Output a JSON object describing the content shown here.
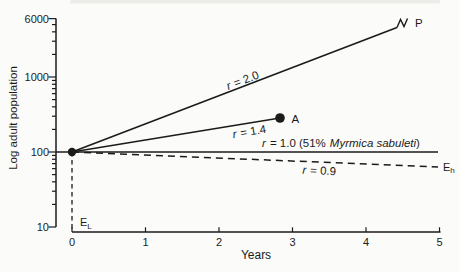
{
  "figure": {
    "ink_color": "#1b1b1b",
    "background_color": "#fbfbf9"
  },
  "chart_data": {
    "type": "line",
    "title": "",
    "xlabel": "Years",
    "ylabel": "Log adult population",
    "x_range": [
      0,
      5
    ],
    "y_scale": "log",
    "y_range": [
      10,
      6000
    ],
    "x_ticks": [
      "0",
      "1",
      "2",
      "3",
      "4",
      "5"
    ],
    "y_ticks": [
      "6000",
      "1000",
      "100",
      "10"
    ],
    "initial_population": 100,
    "series": [
      {
        "name": "r = 2.0",
        "line_style": "solid",
        "points": [
          [
            0,
            100
          ],
          [
            4.42,
            4800
          ]
        ],
        "end_marker": "break-squiggle",
        "end_label": "P"
      },
      {
        "name": "r = 1.4",
        "line_style": "solid",
        "points": [
          [
            0,
            100
          ],
          [
            2.83,
            284
          ]
        ],
        "end_marker": "filled-circle",
        "end_label": "A"
      },
      {
        "name": "r = 1.0 (51% Myrmica sabuleti)",
        "line_style": "solid",
        "points": [
          [
            0,
            100
          ],
          [
            5,
            100
          ]
        ],
        "end_marker": "none",
        "end_label": ""
      },
      {
        "name": "r = 0.9",
        "line_style": "dashed",
        "points": [
          [
            0,
            100
          ],
          [
            4.98,
            63
          ]
        ],
        "end_marker": "none",
        "end_label": "Eh"
      }
    ],
    "guides": [
      {
        "type": "dashed-vertical",
        "x": 0,
        "label": "EL"
      }
    ],
    "start_point": {
      "x": 0,
      "y": 100,
      "marker": "filled-circle"
    }
  },
  "labels": {
    "r20": {
      "var": "r",
      "value": "= 2.0"
    },
    "r14": {
      "var": "r",
      "value": "= 1.4"
    },
    "r10": {
      "var": "r",
      "value": "= 1.0 (51%",
      "species": "Myrmica sabuleti",
      "close": ")"
    },
    "r09": {
      "var": "r",
      "value": "= 0.9"
    },
    "p": "P",
    "a": "A",
    "eh": {
      "base": "E",
      "sub": "h"
    },
    "el": {
      "base": "E",
      "sub": "L"
    }
  }
}
